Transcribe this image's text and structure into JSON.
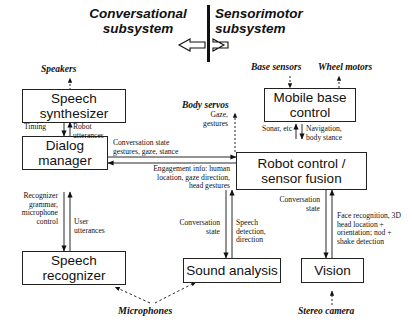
{
  "diagram": {
    "headers": {
      "left": "Conversational\nsubsystem",
      "left_line1": "Conversational",
      "left_line2": "subsystem",
      "right_line1": "Sensorimotor",
      "right_line2": "subsystem"
    },
    "boxes": {
      "speech_synthesizer_l1": "Speech",
      "speech_synthesizer_l2": "synthesizer",
      "dialog_manager_l1": "Dialog",
      "dialog_manager_l2": "manager",
      "speech_recognizer_l1": "Speech",
      "speech_recognizer_l2": "recognizer",
      "mobile_base_l1": "Mobile base",
      "mobile_base_l2": "control",
      "robot_control_l1": "Robot control /",
      "robot_control_l2": "sensor fusion",
      "sound_analysis": "Sound analysis",
      "vision": "Vision"
    },
    "external": {
      "speakers": "Speakers",
      "base_sensors": "Base sensors",
      "wheel_motors": "Wheel motors",
      "body_servos": "Body servos",
      "microphones": "Microphones",
      "stereo_camera": "Stereo camera"
    },
    "edge_labels": {
      "timing": "Timing",
      "robot_utterances_l1": "Robot",
      "robot_utterances_l2": "utterances",
      "recognizer_ctrl_l1": "Recognizer",
      "recognizer_ctrl_l2": "grammar,",
      "recognizer_ctrl_l3": "microphone",
      "recognizer_ctrl_l4": "control",
      "user_utterances_l1": "User",
      "user_utterances_l2": "utterances",
      "gaze_gestures_l1": "Gaze,",
      "gaze_gestures_l2": "gestures",
      "conv_state_gestures_l1": "Conversation state",
      "conv_state_gestures_l2": "gestures, gaze, stance",
      "engagement_l1": "Engagement info: human",
      "engagement_l2": "location, gaze direction,",
      "engagement_l3": "head gestures",
      "sonar": "Sonar, etc",
      "navigation_l1": "Navigation,",
      "navigation_l2": "body stance",
      "conv_state_sound_l1": "Conversation",
      "conv_state_sound_l2": "state",
      "speech_detection_l1": "Speech",
      "speech_detection_l2": "detection,",
      "speech_detection_l3": "direction",
      "conv_state_vision_l1": "Conversation",
      "conv_state_vision_l2": "state",
      "face_recog_l1": "Face recognition, 3D",
      "face_recog_l2": "head location +",
      "face_recog_l3": "orientation; nod +",
      "face_recog_l4": "shake detection"
    },
    "colors": {
      "stroke": "#222222",
      "background": "#ffffff",
      "text": "#111111"
    }
  }
}
